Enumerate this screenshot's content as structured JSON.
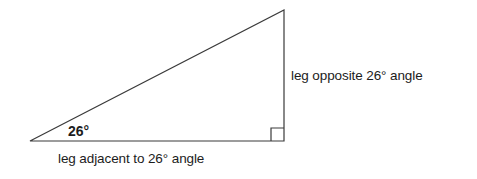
{
  "figure": {
    "background_color": "#ffffff",
    "stroke_color": "#3a3a3a",
    "text_color": "#1c1c1c",
    "stroke_width": 1.2
  },
  "labels": {
    "opposite_leg": "leg opposite 26° angle",
    "adjacent_leg": "leg adjacent to 26° angle",
    "angle": "26°"
  },
  "geometry": {
    "left_vertex": {
      "x": 30,
      "y": 141
    },
    "apex_vertex": {
      "x": 284,
      "y": 10
    },
    "right_angle_vertex": {
      "x": 284,
      "y": 141
    },
    "right_angle_marker": {
      "x": 271,
      "y": 128,
      "size": 13
    },
    "angle_measure_degrees": 26
  }
}
